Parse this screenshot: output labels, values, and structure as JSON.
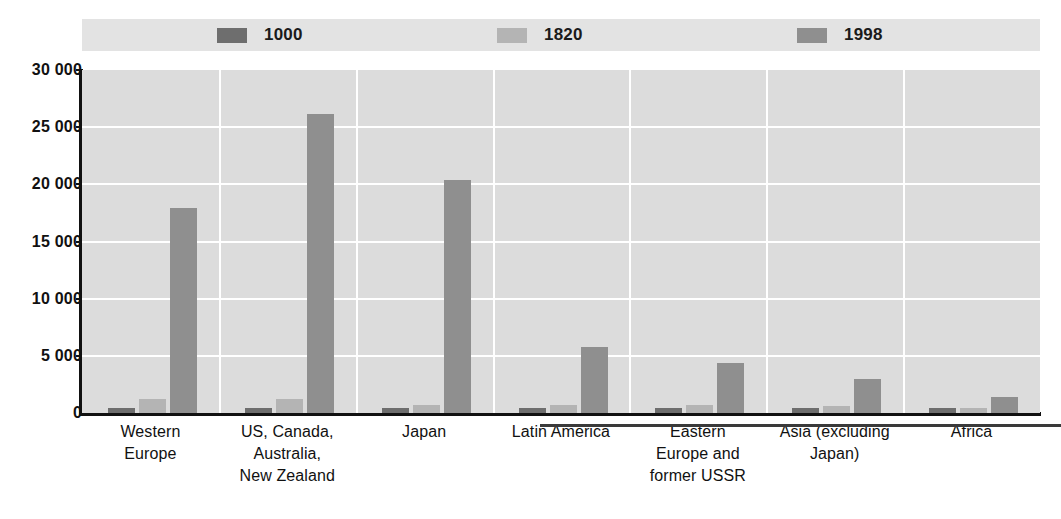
{
  "figure": {
    "title_remnant": "",
    "background_color": "#ffffff",
    "plot_background_color": "#dcdcdc",
    "gridline_color": "#ffffff",
    "axis_color": "#111111"
  },
  "legend": {
    "position": "top",
    "background_color": "#e3e3e3",
    "items": [
      {
        "label": "1000",
        "color": "#6e6e6e"
      },
      {
        "label": "1820",
        "color": "#b4b4b4"
      },
      {
        "label": "1998",
        "color": "#8f8f8f"
      }
    ]
  },
  "yaxis": {
    "ticks": [
      "30 000",
      "25 000",
      "20 000",
      "15 000",
      "10 000",
      "5 000",
      "0"
    ],
    "min": 0,
    "max": 30000,
    "step": 5000
  },
  "chart_data": {
    "type": "bar",
    "title": "",
    "subtitle": "",
    "xlabel": "",
    "ylabel": "",
    "ylim": [
      0,
      30000
    ],
    "ytick_values": [
      0,
      5000,
      10000,
      15000,
      20000,
      25000,
      30000
    ],
    "ytick_labels": [
      "0",
      "5 000",
      "10 000",
      "15 000",
      "20 000",
      "25 000",
      "30 000"
    ],
    "grid": true,
    "legend_position": "top",
    "categories": [
      "Western Europe",
      "US, Canada, Australia, New Zealand",
      "Japan",
      "Latin America",
      "Eastern Europe and former USSR",
      "Asia (excluding Japan)",
      "Africa"
    ],
    "category_label_lines": [
      [
        "Western",
        "Europe"
      ],
      [
        "US, Canada,",
        "Australia,",
        "New Zealand"
      ],
      [
        "Japan"
      ],
      [
        "Latin America"
      ],
      [
        "Eastern",
        "Europe and",
        "former USSR"
      ],
      [
        "Asia (excluding",
        "Japan)"
      ],
      [
        "Africa"
      ]
    ],
    "series": [
      {
        "name": "1000",
        "color": "#6e6e6e",
        "values": [
          400,
          400,
          425,
          400,
          400,
          450,
          425
        ]
      },
      {
        "name": "1820",
        "color": "#b4b4b4",
        "values": [
          1232,
          1201,
          669,
          665,
          667,
          575,
          418
        ]
      },
      {
        "name": "1998",
        "color": "#8f8f8f",
        "values": [
          17921,
          26146,
          20413,
          5795,
          4354,
          2936,
          1368
        ]
      }
    ]
  }
}
